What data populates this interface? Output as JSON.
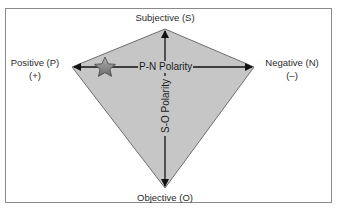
{
  "diagram": {
    "type": "polarity-kite",
    "vertices": {
      "top": {
        "label": "Subjective (S)"
      },
      "left": {
        "label": "Positive (P)",
        "sublabel": "(+)"
      },
      "right": {
        "label": "Negative (N)",
        "sublabel": "(–)"
      },
      "bottom": {
        "label": "Objective (O)"
      }
    },
    "axes": {
      "horizontal": {
        "label": "P-N Polarity"
      },
      "vertical": {
        "label": "S-O Polarity"
      }
    },
    "marker": {
      "icon": "star-icon",
      "position": "near positive pole on P-N axis"
    },
    "colors": {
      "kite_fill": "#c6c6c6",
      "kite_stroke": "#6e6e6e",
      "arrow": "#111111",
      "frame_border": "#8a8a8a",
      "star_fill": "#8c8c8c",
      "star_stroke": "#444444"
    }
  }
}
